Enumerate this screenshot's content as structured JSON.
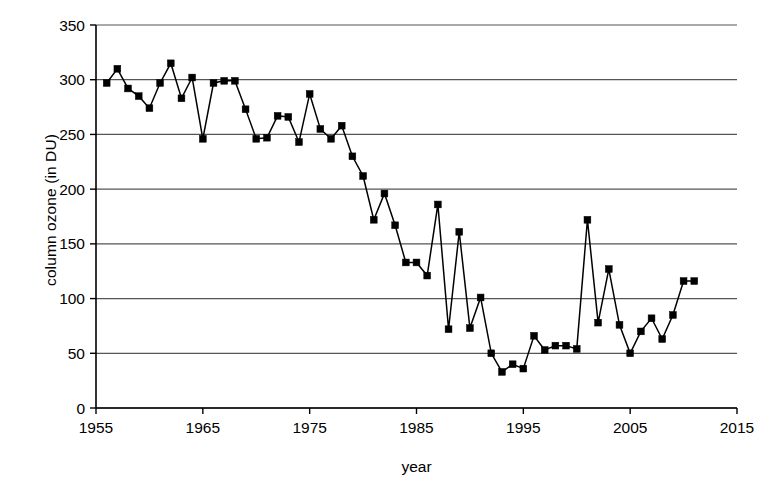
{
  "chart_data": {
    "type": "line",
    "title": "",
    "subtitle": "",
    "xlabel": "year",
    "ylabel": "column ozone (in DU)",
    "xlim": [
      1955,
      2015
    ],
    "ylim": [
      0,
      350
    ],
    "xticks": [
      1955,
      1965,
      1975,
      1985,
      1995,
      2005,
      2015
    ],
    "yticks": [
      0,
      50,
      100,
      150,
      200,
      250,
      300,
      350
    ],
    "xtick_labels": [
      "1955",
      "1965",
      "1975",
      "1985",
      "1995",
      "2005",
      "2015"
    ],
    "ytick_labels": [
      "0",
      "50",
      "100",
      "150",
      "200",
      "250",
      "300",
      "350"
    ],
    "grid": "horizontal",
    "legend": "none",
    "marker": "filled-square",
    "line_color": "#000000",
    "marker_color": "#000000",
    "x": [
      1956,
      1957,
      1958,
      1959,
      1960,
      1961,
      1962,
      1963,
      1964,
      1965,
      1966,
      1967,
      1968,
      1969,
      1970,
      1971,
      1972,
      1973,
      1974,
      1975,
      1976,
      1977,
      1978,
      1979,
      1980,
      1981,
      1982,
      1983,
      1984,
      1985,
      1986,
      1987,
      1988,
      1989,
      1990,
      1991,
      1992,
      1993,
      1994,
      1995,
      1996,
      1997,
      1998,
      1999,
      2000,
      2001,
      2002,
      2003,
      2004,
      2005,
      2006,
      2007,
      2008,
      2009,
      2010,
      2011
    ],
    "values": [
      297,
      310,
      292,
      285,
      274,
      297,
      315,
      283,
      302,
      246,
      297,
      299,
      299,
      273,
      246,
      247,
      267,
      266,
      243,
      287,
      255,
      246,
      258,
      230,
      212,
      172,
      196,
      167,
      133,
      133,
      121,
      186,
      72,
      161,
      73,
      101,
      50,
      33,
      40,
      36,
      66,
      53,
      57,
      57,
      54,
      172,
      78,
      127,
      76,
      50,
      70,
      82,
      63,
      85,
      116,
      116
    ],
    "series": [
      {
        "name": "column ozone",
        "values": [
          297,
          310,
          292,
          285,
          274,
          297,
          315,
          283,
          302,
          246,
          297,
          299,
          299,
          273,
          246,
          247,
          267,
          266,
          243,
          287,
          255,
          246,
          258,
          230,
          212,
          172,
          196,
          167,
          133,
          133,
          121,
          186,
          72,
          161,
          73,
          101,
          50,
          33,
          40,
          36,
          66,
          53,
          57,
          57,
          54,
          172,
          78,
          127,
          76,
          50,
          70,
          82,
          63,
          85,
          116,
          116
        ]
      }
    ]
  },
  "axes": {
    "y_title": "column ozone (in DU)",
    "x_title": "year"
  }
}
